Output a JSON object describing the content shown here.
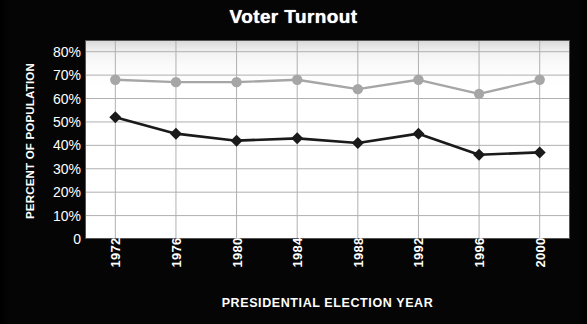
{
  "chart_data": {
    "type": "line",
    "title": "Voter Turnout",
    "xlabel": "PRESIDENTIAL ELECTION YEAR",
    "ylabel": "PERCENT OF POPULATION",
    "categories": [
      "1972",
      "1976",
      "1980",
      "1984",
      "1988",
      "1992",
      "1996",
      "2000"
    ],
    "ytick_labels": [
      "80%",
      "70%",
      "60%",
      "50%",
      "40%",
      "30%",
      "20%",
      "10%",
      "0"
    ],
    "ytick_values": [
      80,
      70,
      60,
      50,
      40,
      30,
      20,
      10,
      0
    ],
    "ylim": [
      0,
      85
    ],
    "grid": true,
    "legend": "none",
    "series": [
      {
        "name": "upper-series",
        "marker": "circle",
        "color": "#a6a6a6",
        "values": [
          68,
          67,
          67,
          68,
          64,
          68,
          62,
          68
        ]
      },
      {
        "name": "lower-series",
        "marker": "diamond",
        "color": "#1a1a1a",
        "values": [
          52,
          45,
          42,
          43,
          41,
          45,
          36,
          37
        ]
      }
    ]
  },
  "colors": {
    "background": "#000000",
    "plot_background": "#ffffff",
    "gridline": "#b0b0b0",
    "text": "#ffffff",
    "series_upper": "#a6a6a6",
    "series_lower": "#1a1a1a"
  }
}
